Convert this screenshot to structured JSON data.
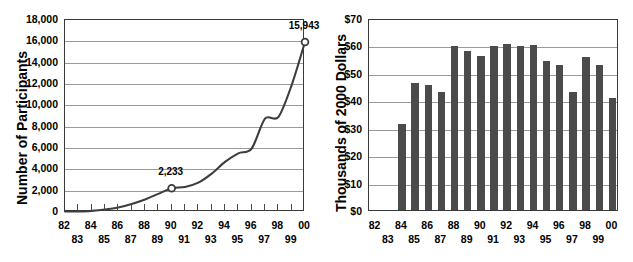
{
  "figure": {
    "background": "#ffffff",
    "ink": "#000000",
    "grid_color": "#9a9a9a",
    "axis_color": "#3a3a3a",
    "bar_color": "#4b4b4b",
    "line_color": "#3d3d3d"
  },
  "charts": [
    {
      "id": "participants-line-chart",
      "chart_data": {
        "type": "line",
        "title": "",
        "xlabel": "",
        "ylabel": "Number of Participants",
        "ylim": [
          0,
          18000
        ],
        "ytick_labels": [
          "18,000",
          "16,000",
          "14,000",
          "12,000",
          "10,000",
          "8,000",
          "6,000",
          "4,000",
          "2,000",
          "0"
        ],
        "ytick_values": [
          18000,
          16000,
          14000,
          12000,
          10000,
          8000,
          6000,
          4000,
          2000,
          0
        ],
        "grid": true,
        "legend": "none",
        "categories": [
          "82",
          "83",
          "84",
          "85",
          "86",
          "87",
          "88",
          "89",
          "90",
          "91",
          "92",
          "93",
          "94",
          "95",
          "96",
          "97",
          "98",
          "99",
          "00"
        ],
        "x": [
          1982,
          1983,
          1984,
          1985,
          1986,
          1987,
          1988,
          1989,
          1990,
          1991,
          1992,
          1993,
          1994,
          1995,
          1996,
          1997,
          1998,
          1999,
          2000
        ],
        "values": [
          40,
          60,
          110,
          230,
          430,
          760,
          1180,
          1700,
          2233,
          2350,
          2750,
          3600,
          4700,
          5500,
          5950,
          8750,
          8900,
          11900,
          15943
        ],
        "marker_points": [
          {
            "x": "90",
            "y": 2233,
            "label": "2,233"
          },
          {
            "x": "00",
            "y": 15943,
            "label": "15,943"
          }
        ],
        "xtick_labels_top": [
          "82",
          "84",
          "86",
          "88",
          "90",
          "92",
          "94",
          "96",
          "98",
          "00"
        ],
        "xtick_labels_bottom": [
          "83",
          "85",
          "87",
          "89",
          "91",
          "93",
          "95",
          "97",
          "99"
        ]
      }
    },
    {
      "id": "dollars-bar-chart",
      "chart_data": {
        "type": "bar",
        "title": "",
        "xlabel": "",
        "ylabel": "Thousands of 2000 Dollars",
        "ylim": [
          0,
          70
        ],
        "ytick_labels": [
          "$70",
          "$60",
          "$50",
          "$40",
          "$30",
          "$20",
          "$10",
          "$0"
        ],
        "ytick_values": [
          70,
          60,
          50,
          40,
          30,
          20,
          10,
          0
        ],
        "grid": true,
        "legend": "none",
        "categories": [
          "82",
          "83",
          "84",
          "85",
          "86",
          "87",
          "88",
          "89",
          "90",
          "91",
          "92",
          "93",
          "94",
          "95",
          "96",
          "97",
          "98",
          "99",
          "00"
        ],
        "values": [
          null,
          null,
          31.3,
          46.3,
          45.7,
          43.2,
          59.8,
          58.1,
          56.2,
          59.7,
          60.4,
          59.7,
          60.2,
          54.4,
          53.0,
          43.2,
          55.8,
          52.7,
          41.0
        ],
        "xtick_labels_top": [
          "82",
          "84",
          "86",
          "88",
          "90",
          "92",
          "94",
          "96",
          "98",
          "00"
        ],
        "xtick_labels_bottom": [
          "83",
          "85",
          "87",
          "89",
          "91",
          "93",
          "95",
          "97",
          "99"
        ]
      }
    }
  ]
}
